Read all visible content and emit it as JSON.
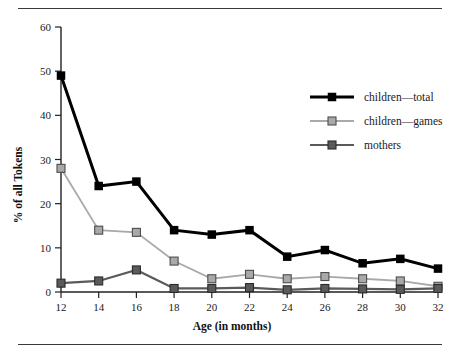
{
  "chart_data": {
    "type": "line",
    "title": "",
    "xlabel": "Age (in months)",
    "ylabel": "% of all Tokens",
    "x": [
      12,
      14,
      16,
      18,
      20,
      22,
      24,
      26,
      28,
      30,
      32
    ],
    "xticklabels": [
      "12",
      "14",
      "16",
      "18",
      "20",
      "22",
      "24",
      "26",
      "28",
      "30",
      "32"
    ],
    "yticks": [
      0,
      10,
      20,
      30,
      40,
      50,
      60
    ],
    "yticklabels": [
      "0",
      "10",
      "20",
      "30",
      "40",
      "50",
      "60"
    ],
    "xlim": [
      12,
      32
    ],
    "ylim": [
      0,
      60
    ],
    "grid": false,
    "legend_position": "upper right",
    "series": [
      {
        "name": "children—total",
        "color": "#000000",
        "marker": "square-filled",
        "values": [
          49,
          24,
          25,
          14,
          13,
          14,
          8,
          9.5,
          6.5,
          7.5,
          5.3
        ]
      },
      {
        "name": "children—games",
        "color": "#a9a9a9",
        "marker": "square-light",
        "values": [
          28,
          14,
          13.5,
          7,
          3,
          4,
          3,
          3.5,
          3,
          2.5,
          1.3
        ]
      },
      {
        "name": "mothers",
        "color": "#5a5a5a",
        "marker": "square-dark",
        "values": [
          2,
          2.5,
          5,
          0.8,
          0.8,
          1,
          0.5,
          0.8,
          0.7,
          0.6,
          0.8
        ]
      }
    ]
  },
  "legend": {
    "entries": [
      {
        "label": "children—total"
      },
      {
        "label": "children—games"
      },
      {
        "label": "mothers"
      }
    ]
  },
  "colors": {
    "children_total": "#000000",
    "children_games": "#a9a9a9",
    "mothers": "#5a5a5a",
    "axis": "#222222",
    "rule": "#3a3a3a",
    "background": "#ffffff"
  }
}
